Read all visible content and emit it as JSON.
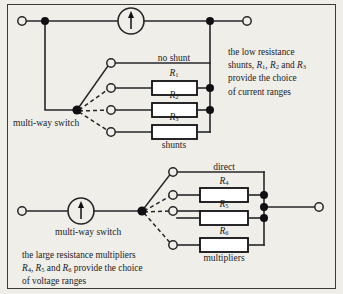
{
  "figure": {
    "background_color": "#efeee9",
    "ink_color": "#26262a",
    "frame_color": "#3a3a38"
  },
  "top_circuit": {
    "name": "ammeter shunt network",
    "meter_label": "moving-coil meter",
    "switch_label": "multi-way switch",
    "direct_label": "no shunt",
    "group_label": "shunts",
    "resistors": [
      {
        "label": "R",
        "sub": "1"
      },
      {
        "label": "R",
        "sub": "2"
      },
      {
        "label": "R",
        "sub": "3"
      }
    ],
    "note": {
      "line1": "the low resistance",
      "line2_pre": "shunts, ",
      "line2_r1": "R",
      "line2_r1_sub": "1",
      "line2_mid": ", ",
      "line2_r2": "R",
      "line2_r2_sub": "2",
      "line2_and": " and ",
      "line2_r3": "R",
      "line2_r3_sub": "3",
      "line3": "provide the choice",
      "line4": "of current ranges"
    }
  },
  "bottom_circuit": {
    "name": "voltmeter multiplier network",
    "meter_label": "moving-coil meter",
    "switch_label": "multi-way switch",
    "direct_label": "direct",
    "group_label": "multipliers",
    "resistors": [
      {
        "label": "R",
        "sub": "4"
      },
      {
        "label": "R",
        "sub": "5"
      },
      {
        "label": "R",
        "sub": "6"
      }
    ],
    "note": {
      "line1": "the large resistance multipliers",
      "line2_r4": "R",
      "line2_r4_sub": "4",
      "line2_mid": ", ",
      "line2_r5": "R",
      "line2_r5_sub": "5",
      "line2_and": " and ",
      "line2_r6": "R",
      "line2_r6_sub": "6",
      "line2_tail": " provide the choice",
      "line3": "of voltage ranges"
    }
  }
}
